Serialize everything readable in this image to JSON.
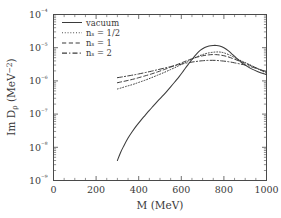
{
  "chart_data": {
    "type": "line",
    "title": "",
    "xlabel": "M  (MeV)",
    "ylabel": "Im Dρ  (MeV⁻²)",
    "xlim": [
      0,
      1000
    ],
    "ylim": [
      1e-09,
      0.0001
    ],
    "yscale": "log",
    "xscale": "linear",
    "grid": false,
    "legend_position": "top-left-inside",
    "xticks": [
      0,
      200,
      400,
      600,
      800,
      1000
    ],
    "xticklabels": [
      "0",
      "200",
      "400",
      "600",
      "800",
      "1000"
    ],
    "yticks": [
      0.0001,
      1e-05,
      1e-06,
      1e-07,
      1e-08,
      1e-09
    ],
    "yticklabels": [
      "10⁻⁴",
      "10⁻⁵",
      "10⁻⁶",
      "10⁻⁷",
      "10⁻⁸",
      "10⁻⁹"
    ],
    "series": [
      {
        "name": "vacuum",
        "label": "vacuum",
        "style": "solid",
        "x": [
          300,
          315,
          330,
          350,
          370,
          390,
          410,
          430,
          450,
          470,
          490,
          510,
          530,
          550,
          570,
          590,
          610,
          630,
          650,
          670,
          690,
          710,
          730,
          750,
          765,
          780,
          800,
          820,
          840,
          860,
          880,
          900,
          930,
          960,
          1000
        ],
        "y": [
          4e-09,
          7e-09,
          1.1e-08,
          1.9e-08,
          3e-08,
          4.5e-08,
          6.5e-08,
          9.2e-08,
          1.3e-07,
          1.8e-07,
          2.5e-07,
          3.4e-07,
          4.7e-07,
          6.6e-07,
          9.4e-07,
          1.35e-06,
          2e-06,
          3e-06,
          4.4e-06,
          6.3e-06,
          8.4e-06,
          1.02e-05,
          1.13e-05,
          1.17e-05,
          1.17e-05,
          1.13e-05,
          1e-05,
          8.2e-06,
          6.3e-06,
          4.8e-06,
          3.7e-06,
          3e-06,
          2.3e-06,
          1.9e-06,
          1.55e-06
        ]
      },
      {
        "name": "n_s_half",
        "label": "nₛ = 1/2",
        "style": "dotted",
        "x": [
          300,
          320,
          340,
          360,
          380,
          400,
          430,
          460,
          490,
          520,
          550,
          580,
          610,
          640,
          670,
          700,
          730,
          760,
          780,
          800,
          830,
          860,
          890,
          920,
          960,
          1000
        ],
        "y": [
          5.7e-07,
          6.2e-07,
          6.8e-07,
          7.4e-07,
          8.1e-07,
          9e-07,
          1.05e-06,
          1.25e-06,
          1.5e-06,
          1.8e-06,
          2.2e-06,
          2.7e-06,
          3.4e-06,
          4.2e-06,
          5.2e-06,
          6.2e-06,
          7e-06,
          7.4e-06,
          7.4e-06,
          7e-06,
          5.9e-06,
          4.7e-06,
          3.8e-06,
          3.1e-06,
          2.3e-06,
          1.7e-06
        ]
      },
      {
        "name": "n_s_1",
        "label": "nₛ = 1",
        "style": "dashed",
        "x": [
          300,
          320,
          340,
          360,
          380,
          400,
          430,
          460,
          490,
          520,
          550,
          580,
          610,
          640,
          670,
          700,
          730,
          760,
          790,
          820,
          850,
          880,
          910,
          950,
          1000
        ],
        "y": [
          8.8e-07,
          9.4e-07,
          1e-06,
          1.07e-06,
          1.15e-06,
          1.25e-06,
          1.42e-06,
          1.62e-06,
          1.88e-06,
          2.2e-06,
          2.6e-06,
          3.1e-06,
          3.7e-06,
          4.4e-06,
          5.1e-06,
          5.7e-06,
          6.1e-06,
          6.2e-06,
          5.9e-06,
          5.3e-06,
          4.5e-06,
          3.8e-06,
          3.2e-06,
          2.5e-06,
          1.8e-06
        ]
      },
      {
        "name": "n_s_2",
        "label": "nₛ = 2",
        "style": "dashdot",
        "x": [
          300,
          320,
          340,
          360,
          380,
          400,
          430,
          460,
          490,
          520,
          550,
          580,
          610,
          640,
          670,
          700,
          730,
          760,
          790,
          820,
          850,
          880,
          910,
          950,
          1000
        ],
        "y": [
          1.25e-06,
          1.31e-06,
          1.38e-06,
          1.45e-06,
          1.53e-06,
          1.62e-06,
          1.78e-06,
          1.96e-06,
          2.18e-06,
          2.42e-06,
          2.7e-06,
          3e-06,
          3.3e-06,
          3.6e-06,
          3.85e-06,
          4.05e-06,
          4.15e-06,
          4.15e-06,
          4e-06,
          3.8e-06,
          3.5e-06,
          3.2e-06,
          2.9e-06,
          2.4e-06,
          1.9e-06
        ]
      }
    ]
  },
  "axes": {
    "xlabel": "M  (MeV)",
    "ylabel_parts": {
      "im": "Im D",
      "sub": "ρ",
      "unit": "(MeV",
      "unit_exp": "−2",
      "unit_close": ")"
    }
  },
  "colors": {
    "line": "#3b3b3b",
    "axis": "#4a4a4a",
    "background": "#ffffff",
    "text": "#3a3a3a"
  }
}
